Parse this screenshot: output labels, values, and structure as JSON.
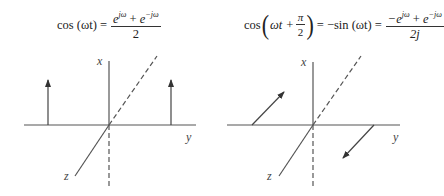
{
  "left": {
    "equation": {
      "lhs": "cos (ωt) =",
      "numerator_a": "e",
      "numerator_a_exp": "jω",
      "numerator_op": " + ",
      "numerator_b": "e",
      "numerator_b_exp": "−jω",
      "denominator": "2"
    },
    "axes": {
      "x": "x",
      "y": "y",
      "z": "z"
    }
  },
  "right": {
    "equation": {
      "lhs_prefix": "cos",
      "lhs_inner": "ωt + ",
      "pi_num": "π",
      "pi_den": "2",
      "middle": "= −sin (ωt) =",
      "numerator_a": "−e",
      "numerator_a_exp": "jω",
      "numerator_op": " + ",
      "numerator_b": "e",
      "numerator_b_exp": "−jω",
      "denominator": "2j"
    },
    "axes": {
      "x": "x",
      "y": "y",
      "z": "z"
    }
  },
  "colors": {
    "line": "#555555",
    "text": "#222222"
  }
}
